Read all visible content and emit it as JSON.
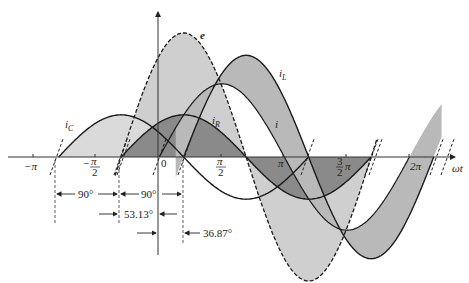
{
  "chart_data": {
    "type": "line",
    "title": "",
    "xlabel": "ωt",
    "ylabel": "",
    "x_ticks": [
      "−π",
      "−π/2",
      "0",
      "π/2",
      "π",
      "3/2 π",
      "2π"
    ],
    "series": [
      {
        "name": "e",
        "style": "dashed",
        "amplitude_rel": 1.0,
        "phase_deg": 53.13,
        "note": "source voltage"
      },
      {
        "name": "iR",
        "label": "i_R",
        "style": "solid",
        "amplitude_rel": 0.34,
        "phase_deg": 53.13,
        "note": "in phase with e"
      },
      {
        "name": "iC",
        "label": "i_C",
        "style": "solid",
        "amplitude_rel": 0.34,
        "phase_deg": 143.13,
        "note": "leads e by 90°"
      },
      {
        "name": "iL",
        "label": "i_L",
        "style": "solid",
        "amplitude_rel": 0.82,
        "phase_deg": -36.87,
        "note": "lags e by 90°"
      },
      {
        "name": "i",
        "label": "i",
        "style": "solid",
        "amplitude_rel": 0.59,
        "phase_deg": -1.9,
        "note": "total current"
      }
    ],
    "annotations": [
      "90°",
      "90°",
      "53.13°",
      "36.87°"
    ]
  },
  "labels": {
    "e": "e",
    "iL_main": "i",
    "iL_sub": "L",
    "iR_main": "i",
    "iR_sub": "R",
    "iC_main": "i",
    "iC_sub": "C",
    "i": "i",
    "axis": "ωt",
    "t_neg_pi": "−π",
    "t_neg_half_pi_num": "π",
    "t_neg_half_pi_den": "2",
    "t_neg_sign": "−",
    "t_zero": "0",
    "t_half_pi_num": "π",
    "t_half_pi_den": "2",
    "t_pi": "π",
    "t_3half_num": "3",
    "t_3half_den": "2",
    "t_3half_pi": "π",
    "t_2pi": "2π",
    "dim_90a": "90°",
    "dim_90b": "90°",
    "dim_53": "53.13°",
    "dim_36": "36.87°"
  }
}
